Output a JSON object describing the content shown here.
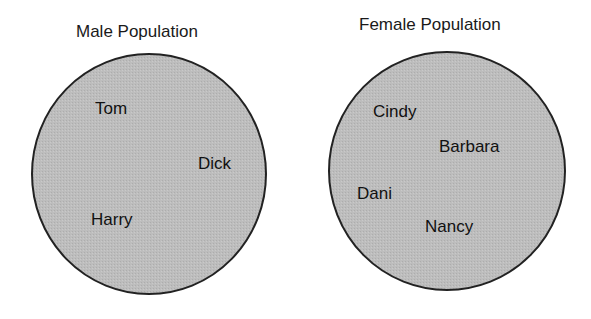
{
  "diagram": {
    "type": "set-diagram",
    "sets": [
      {
        "title": "Male Population",
        "members": [
          "Tom",
          "Dick",
          "Harry"
        ]
      },
      {
        "title": "Female Population",
        "members": [
          "Cindy",
          "Barbara",
          "Dani",
          "Nancy"
        ]
      }
    ],
    "colors": {
      "fill": "#bdbdbd",
      "stroke": "#222222"
    }
  }
}
